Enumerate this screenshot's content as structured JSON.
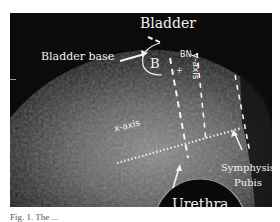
{
  "figure": {
    "labels": {
      "bladder": "Bladder",
      "bladder_base": "Bladder base",
      "bn": "BN",
      "b": "B",
      "y_axis": "y-axis",
      "x_axis": "x-axis",
      "symphysis": "Symphysis",
      "pubis": "Pubis",
      "urethra": "Urethra"
    },
    "colors": {
      "background": "#0b0b0b",
      "tissue": "#7a7a7a",
      "annotation": "#f2f2f2"
    }
  },
  "caption": {
    "text": "Fig. 1. The ..."
  }
}
